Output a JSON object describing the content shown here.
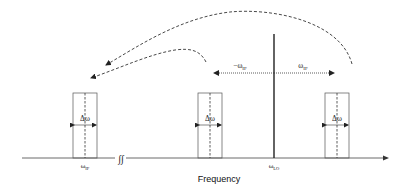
{
  "diagram": {
    "type": "frequency-spectrum-mixing",
    "axis": {
      "label": "Frequency"
    },
    "markers": {
      "if": {
        "symbol": "ω",
        "subscript": "IF"
      },
      "lo": {
        "symbol": "ω",
        "subscript": "LO"
      }
    },
    "bands": [
      {
        "id": "if-band",
        "width_label": "Δω"
      },
      {
        "id": "lower-sideband",
        "width_label": "Δω"
      },
      {
        "id": "upper-sideband",
        "width_label": "Δω"
      }
    ],
    "offsets": {
      "negative": {
        "text": "−ω",
        "subscript": "IF"
      },
      "positive": {
        "text": "ω",
        "subscript": "IF"
      }
    },
    "axis_break_symbol": "∫∫",
    "colors": {
      "line": "#333333",
      "lo_line": "#222222",
      "box": "#555555"
    }
  }
}
